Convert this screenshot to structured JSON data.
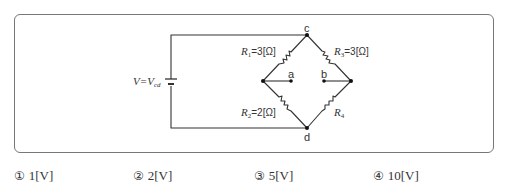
{
  "diagram": {
    "nodes": {
      "c": "c",
      "d": "d",
      "a": "a",
      "b": "b"
    },
    "source": {
      "label_prefix": "V=V",
      "label_sub": "cd"
    },
    "resistors": [
      {
        "id": "R1",
        "prefix": "R",
        "sub": "1",
        "value": "=3[Ω]"
      },
      {
        "id": "R2",
        "prefix": "R",
        "sub": "2",
        "value": "=2[Ω]"
      },
      {
        "id": "R3",
        "prefix": "R",
        "sub": "3",
        "value": "=3[Ω]"
      },
      {
        "id": "R4",
        "prefix": "R",
        "sub": "4",
        "value": ""
      }
    ]
  },
  "choices": [
    {
      "num": "①",
      "text": "1[V]"
    },
    {
      "num": "②",
      "text": "2[V]"
    },
    {
      "num": "③",
      "text": "5[V]"
    },
    {
      "num": "④",
      "text": "10[V]"
    }
  ]
}
